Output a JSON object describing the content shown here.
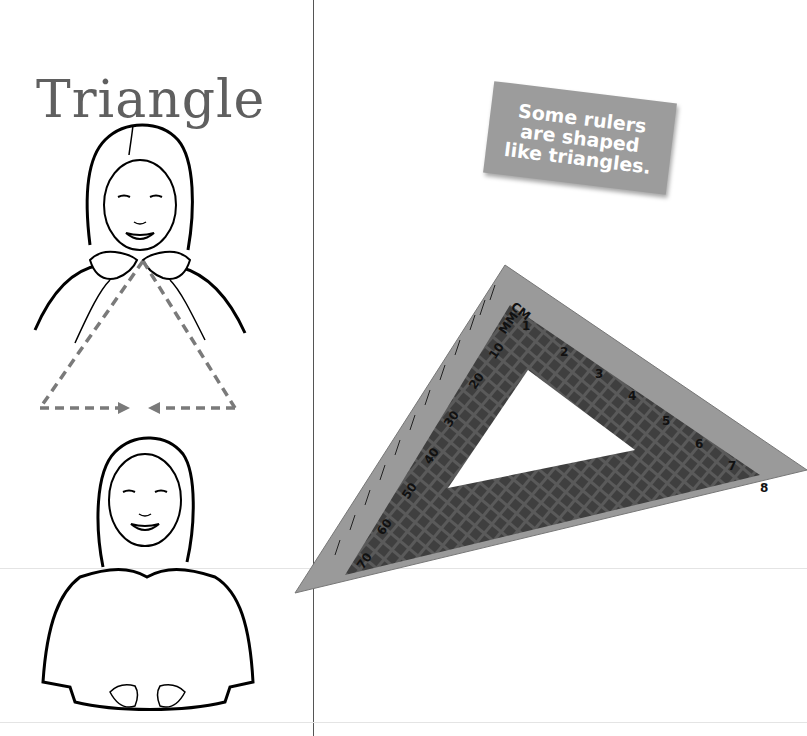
{
  "page": {
    "title": "Triangle",
    "callout": {
      "lines": [
        "Some rulers",
        "are shaped",
        "like triangles."
      ]
    }
  },
  "illustrations": {
    "sign_start": "girl-signing-triangle-start",
    "sign_end": "girl-signing-triangle-end",
    "motion_path": "dashed-triangle-with-arrows"
  },
  "ruler": {
    "cm_label": "CM",
    "mm_label": "MM",
    "cm_marks": [
      "1",
      "2",
      "3",
      "4",
      "5",
      "6",
      "7",
      "8"
    ],
    "mm_marks": [
      "10",
      "20",
      "30",
      "40",
      "50",
      "60",
      "70"
    ]
  },
  "colors": {
    "title": "#5f5f5f",
    "callout_bg": "#9c9c9c",
    "callout_text": "#ffffff",
    "dash": "#7a7a7a",
    "ruler": "#9a9a9a",
    "ruler_grid": "#555555"
  }
}
